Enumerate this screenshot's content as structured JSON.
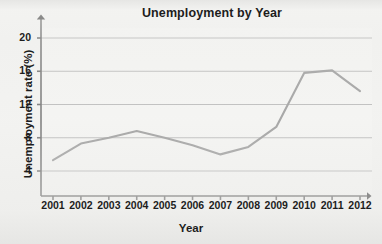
{
  "chart_data": {
    "type": "line",
    "title": "Unemployment by Year",
    "xlabel": "Year",
    "ylabel": "Unemployment rate (%)",
    "x": [
      2001,
      2002,
      2003,
      2004,
      2005,
      2006,
      2007,
      2008,
      2009,
      2010,
      2011,
      2012
    ],
    "categories": [
      "2001",
      "2002",
      "2003",
      "2004",
      "2005",
      "2006",
      "2007",
      "2008",
      "2009",
      "2010",
      "2011",
      "2012"
    ],
    "values": [
      5.3,
      7.3,
      8.0,
      8.8,
      8.0,
      7.1,
      6.0,
      6.9,
      9.3,
      15.8,
      16.1,
      13.6
    ],
    "series": [
      {
        "name": "Unemployment rate",
        "values": [
          5.3,
          7.3,
          8.0,
          8.8,
          8.0,
          7.1,
          6.0,
          6.9,
          9.3,
          15.8,
          16.1,
          13.6
        ]
      }
    ],
    "xlim": [
      2001,
      2012
    ],
    "ylim": [
      0,
      22
    ],
    "y_ticks": [
      4,
      8,
      12,
      16,
      20
    ],
    "y_tick_labels": [
      "4",
      "8",
      "12",
      "16",
      "20"
    ],
    "x_ticks": [
      2001,
      2002,
      2003,
      2004,
      2005,
      2006,
      2007,
      2008,
      2009,
      2010,
      2011,
      2012
    ],
    "grid": "horizontal",
    "legend": "none",
    "markers": "none",
    "line_color": "#9a9a9a",
    "grid_color": "#b8b8b8",
    "axis_color": "#6e6e6e",
    "text_color": "#1d1d1d",
    "background_color": "#f2f2f0",
    "plot_background_color": "#f4f4f2",
    "axis_arrows": true
  }
}
